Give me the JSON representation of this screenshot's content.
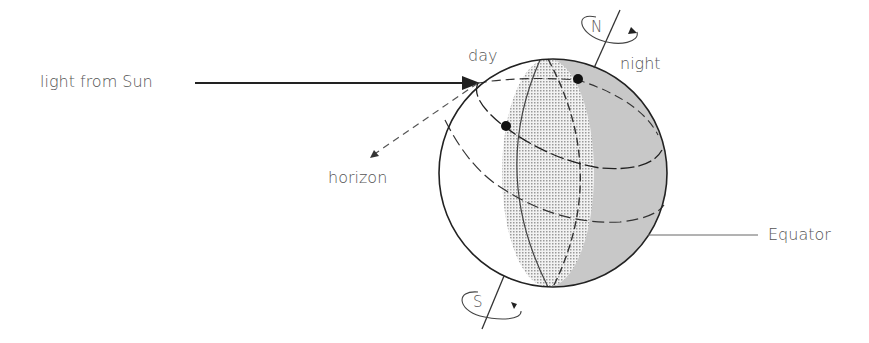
{
  "diagram": {
    "labels": {
      "light": "light from Sun",
      "day": "day",
      "night": "night",
      "horizon": "horizon",
      "equator": "Equator",
      "north": "N",
      "south": "S"
    },
    "colors": {
      "stroke": "#222222",
      "night_fill": "#c8c8c8",
      "day_dots": "#a8a8a8",
      "text": "#555555"
    }
  }
}
